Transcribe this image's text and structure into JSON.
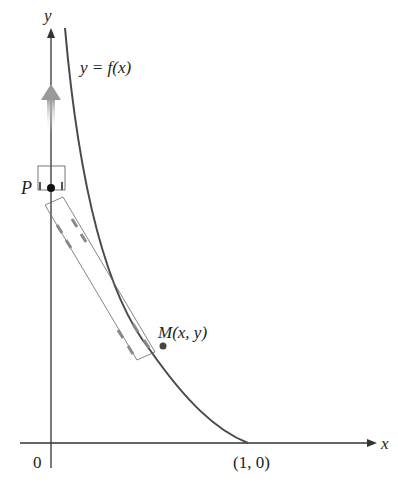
{
  "diagram": {
    "type": "tractrix-pursuit-curve",
    "labels": {
      "y_axis": "y",
      "x_axis": "x",
      "origin": "0",
      "curve": "y = f(x)",
      "point_p": "P",
      "point_m": "M(x, y)",
      "intercept": "(1, 0)"
    },
    "elements": {
      "x_axis": {
        "from": [
          20,
          443
        ],
        "to": [
          375,
          443
        ]
      },
      "y_axis": {
        "from": [
          51,
          468
        ],
        "to": [
          51,
          28
        ]
      },
      "curve": {
        "start": [
          65,
          28
        ],
        "end": [
          248,
          443
        ],
        "color": "#4a4a4a"
      },
      "point_p": [
        51,
        188
      ],
      "point_m": [
        162,
        347
      ],
      "tow_rect_corners": [
        [
          45,
          205
        ],
        [
          63,
          197
        ],
        [
          155,
          352
        ],
        [
          137,
          360
        ]
      ],
      "p_box": {
        "x": 38,
        "y": 166,
        "w": 27,
        "h": 24
      },
      "motion_arrow": {
        "x": 51,
        "y_top": 85,
        "y_bottom": 130,
        "color": "#aaaaaa"
      }
    }
  }
}
